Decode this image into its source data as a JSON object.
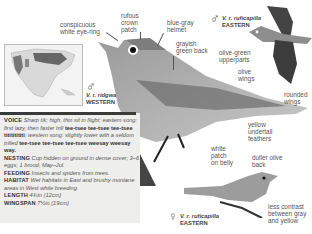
{
  "map": {
    "subspecies_label": "V. r. ridgwayi",
    "region_label": "WESTERN",
    "sex_symbol": "♂"
  },
  "main_bird": {
    "labels": [
      {
        "id": "eye-ring",
        "line1": "conspicuous",
        "line2": "white eye-ring"
      },
      {
        "id": "crown",
        "line1": "rufous",
        "line2": "crown",
        "line3": "patch"
      },
      {
        "id": "helmet",
        "line1": "blue-gray",
        "line2": "helmet"
      },
      {
        "id": "back",
        "line1": "grayish",
        "line2": "green back"
      },
      {
        "id": "wings",
        "line1": "olive",
        "line2": "wings"
      },
      {
        "id": "undertail",
        "line1": "yellow",
        "line2": "undertail",
        "line3": "feathers"
      },
      {
        "id": "belly",
        "line1": "white",
        "line2": "patch",
        "line3": "on belly"
      }
    ]
  },
  "flight_bird": {
    "sex_symbol": "♂",
    "subspecies_label": "V. r. ruficapilla",
    "region_label": "EASTERN",
    "labels": [
      {
        "id": "upperparts",
        "line1": "olive-green",
        "line2": "upperparts"
      },
      {
        "id": "rounded-wings",
        "line1": "rounded",
        "line2": "wings"
      }
    ]
  },
  "female_bird": {
    "sex_symbol": "♀",
    "subspecies_label": "V. r. ruficapilla",
    "region_label": "EASTERN",
    "labels": [
      {
        "id": "duller-back",
        "line1": "duller olive",
        "line2": "back"
      },
      {
        "id": "contrast",
        "line1": "less contrast",
        "line2": "between gray",
        "line3": "and yellow"
      }
    ]
  },
  "info": {
    "voice_key": "VOICE",
    "voice_1": "Sharp tik; high, thin sit in flight; eastern song: first lazy, then faster trill",
    "voice_2": "tee-tsee tee-tsee tee-tsee",
    "voice_3": "titititititi",
    "voice_4": "; western song: slightly lower with a seldom trilled",
    "voice_5": "tee-tsee tee-tsee tee-tsee weesay weesay way.",
    "nesting_key": "NESTING",
    "nesting_val": "Cup hidden on ground in dense cover; 3–6 eggs; 1 brood; May–Jul.",
    "feeding_key": "FEEDING",
    "feeding_val": "Insects and spiders from trees.",
    "habitat_key": "HABITAT",
    "habitat_val": "Wet habitats in East and brushy montane areas in West while breeding.",
    "length_key": "LENGTH",
    "length_val": "4¾in (12cm)",
    "wingspan_key": "WINGSPAN",
    "wingspan_val": "7½in (19cm)"
  }
}
